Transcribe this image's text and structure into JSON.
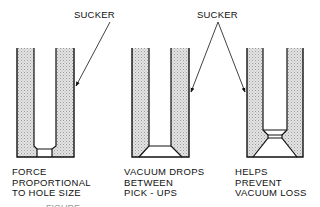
{
  "diagram": {
    "labels": {
      "sucker_left": "SUCKER",
      "sucker_right": "SUCKER"
    },
    "figures": [
      {
        "id": "straight-hole",
        "caption": [
          "FORCE",
          "PROPORTIONAL",
          "TO HOLE SIZE"
        ]
      },
      {
        "id": "open-flare",
        "caption": [
          "VACUUM DROPS",
          "BETWEEN",
          "PICK - UPS"
        ]
      },
      {
        "id": "necked-flare",
        "caption": [
          "HELPS",
          "PREVENT",
          "VACUUM LOSS"
        ]
      }
    ],
    "footer_cut": "FIGURE"
  },
  "colors": {
    "line": "#111111",
    "fill": "#d9d9d9",
    "background": "#ffffff"
  }
}
